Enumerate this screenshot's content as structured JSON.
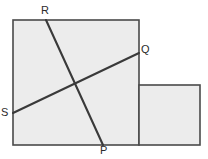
{
  "figure": {
    "type": "geometry-diagram",
    "canvas": {
      "width": 208,
      "height": 159
    },
    "colors": {
      "background": "#ffffff",
      "shape_fill": "#ececec",
      "shape_stroke": "#4a4a4a",
      "segment_stroke": "#3a3a3a",
      "label_text": "#2b2b2b"
    },
    "shapes": [
      {
        "name": "large-square",
        "kind": "rectangle",
        "x": 13,
        "y": 20,
        "width": 126,
        "height": 125
      },
      {
        "name": "small-rectangle",
        "kind": "rectangle",
        "x": 139,
        "y": 85,
        "width": 61,
        "height": 60
      }
    ],
    "segments": [
      {
        "name": "segment-RP",
        "from": "R",
        "to": "P",
        "x1": 46,
        "y1": 20,
        "x2": 103,
        "y2": 145
      },
      {
        "name": "segment-SQ",
        "from": "S",
        "to": "Q",
        "x1": 13,
        "y1": 113,
        "x2": 139,
        "y2": 53
      }
    ],
    "intersection": {
      "name": "segment-crossing-point",
      "x": 75,
      "y": 82
    },
    "labels": [
      {
        "id": "R",
        "text": "R",
        "x": 41,
        "y": 5,
        "anchor": "above-top-edge"
      },
      {
        "id": "Q",
        "text": "Q",
        "x": 141,
        "y": 44,
        "anchor": "right-of-right-edge"
      },
      {
        "id": "S",
        "text": "S",
        "x": 1,
        "y": 107,
        "anchor": "left-of-left-edge"
      },
      {
        "id": "P",
        "text": "P",
        "x": 100,
        "y": 145,
        "anchor": "below-bottom-edge"
      }
    ]
  }
}
